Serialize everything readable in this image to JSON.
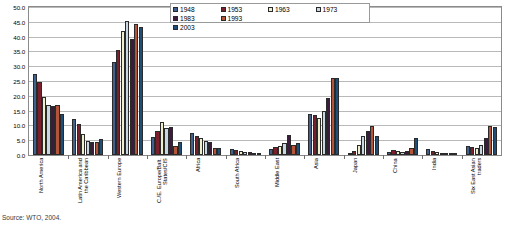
{
  "chart_data": {
    "type": "bar",
    "title": "",
    "xlabel": "",
    "ylabel": "",
    "ylim": [
      0,
      50
    ],
    "ytick_step": 5,
    "grid": true,
    "legend_position": "top-center",
    "ytick_labels": [
      "0.0",
      "5.0",
      "10.0",
      "15.0",
      "20.0",
      "25.0",
      "30.0",
      "35.0",
      "40.0",
      "45.0",
      "50.0"
    ],
    "categories": [
      "North America",
      "Latin America and the Caribbean",
      "Western Europe",
      "C./E. Europe/Balt. States/CIS",
      "Africa",
      "South Africa",
      "Middle East",
      "Asia",
      "Japan",
      "China",
      "India",
      "Six East Asian traders"
    ],
    "category_lines": [
      [
        "North America"
      ],
      [
        "Latin America and",
        "the Caribbean"
      ],
      [
        "Western Europe"
      ],
      [
        "C./E. Europe/Balt.",
        "States/CIS"
      ],
      [
        "Africa"
      ],
      [
        "South Africa"
      ],
      [
        "Middle East"
      ],
      [
        "Asia"
      ],
      [
        "Japan"
      ],
      [
        "China"
      ],
      [
        "India"
      ],
      [
        "Six East Asian",
        "traders"
      ]
    ],
    "series": [
      {
        "name": "1948",
        "color": "#41618f",
        "values": [
          27.5,
          12.3,
          31.5,
          6.0,
          7.3,
          2.0,
          2.0,
          14.0,
          0.4,
          0.9,
          2.2,
          3.0
        ]
      },
      {
        "name": "1953",
        "color": "#7a1f2b",
        "values": [
          24.5,
          10.5,
          35.4,
          8.1,
          6.5,
          1.6,
          2.7,
          13.4,
          1.5,
          1.7,
          1.3,
          2.7
        ]
      },
      {
        "name": "1963",
        "color": "#efeecd",
        "values": [
          19.5,
          7.0,
          41.8,
          11.0,
          5.7,
          1.5,
          3.2,
          12.5,
          3.5,
          1.3,
          1.0,
          2.4
        ]
      },
      {
        "name": "1973",
        "color": "#c9d7e2",
        "values": [
          17.0,
          4.7,
          45.4,
          9.1,
          4.8,
          1.0,
          4.1,
          14.9,
          6.4,
          1.0,
          0.5,
          3.4
        ]
      },
      {
        "name": "1983",
        "color": "#3c1b3f",
        "values": [
          16.5,
          4.5,
          39.3,
          9.5,
          4.5,
          1.0,
          6.8,
          19.1,
          8.0,
          1.2,
          0.5,
          5.8
        ]
      },
      {
        "name": "1993",
        "color": "#b4543a",
        "values": [
          16.9,
          4.4,
          44.3,
          2.9,
          2.5,
          0.7,
          3.5,
          26.0,
          9.9,
          2.5,
          0.6,
          9.7
        ]
      },
      {
        "name": "2003",
        "color": "#1f4e79",
        "values": [
          14.0,
          5.5,
          43.4,
          4.4,
          2.4,
          0.5,
          4.1,
          26.1,
          6.4,
          5.9,
          0.8,
          9.6
        ]
      }
    ]
  },
  "caption": "Source:  WTO, 2004."
}
